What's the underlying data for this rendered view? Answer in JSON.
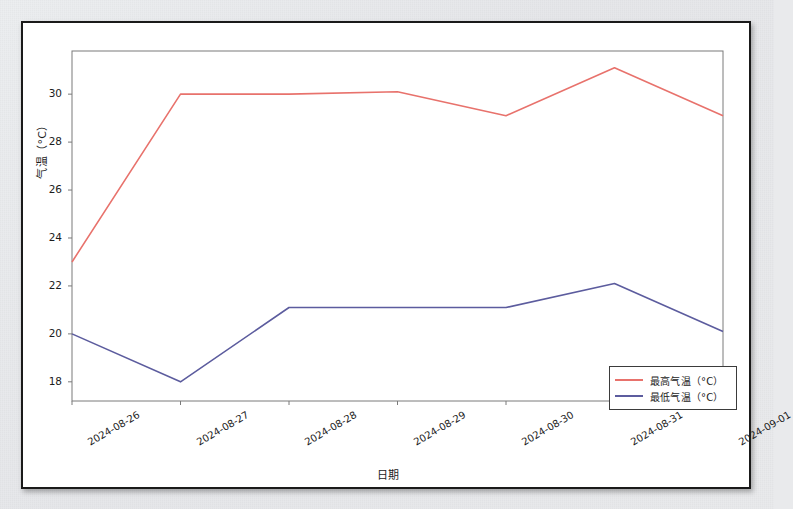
{
  "chart_data": {
    "type": "line",
    "title": "",
    "xlabel": "日期",
    "ylabel": "气温（°C）",
    "categories": [
      "2024-08-26",
      "2024-08-27",
      "2024-08-28",
      "2024-08-29",
      "2024-08-30",
      "2024-08-31",
      "2024-09-01"
    ],
    "series": [
      {
        "name": "最高气温（°C）",
        "color": "#e8726c",
        "values": [
          23.0,
          30.0,
          30.0,
          30.1,
          29.1,
          31.1,
          29.1
        ]
      },
      {
        "name": "最低气温（°C）",
        "color": "#5c5c9e",
        "values": [
          20.0,
          18.0,
          21.1,
          21.1,
          21.1,
          22.1,
          20.1
        ]
      }
    ],
    "ylim": [
      17.2,
      31.8
    ],
    "yticks": [
      18,
      20,
      22,
      24,
      26,
      28,
      30
    ],
    "ytick_labels": [
      "18",
      "20",
      "22",
      "24",
      "26",
      "28",
      "30"
    ],
    "grid": false,
    "legend_position": "lower right",
    "axis_line_color": "#7a7a7a",
    "plot_background": "#ffffff",
    "figure_border_color": "#1a1a1a"
  }
}
